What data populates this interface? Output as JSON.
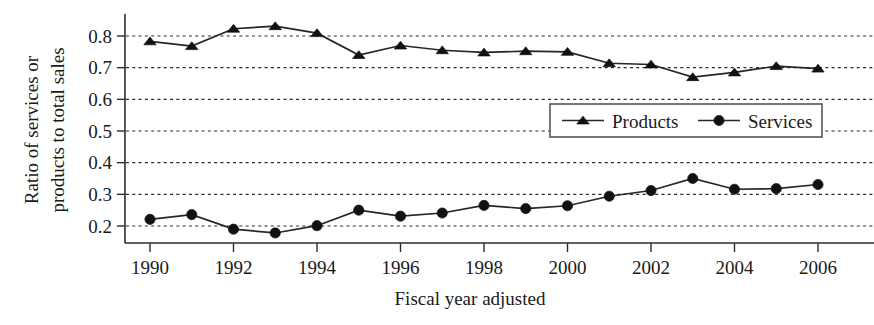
{
  "chart_data": {
    "type": "line",
    "title": "",
    "xlabel": "Fiscal year adjusted",
    "ylabel": "Ratio of services or products to total sales",
    "ylabel_line1": "Ratio of services or",
    "ylabel_line2": "products to total sales",
    "x": [
      1990,
      1991,
      1992,
      1993,
      1994,
      1995,
      1996,
      1997,
      1998,
      1999,
      2000,
      2001,
      2002,
      2003,
      2004,
      2005,
      2006
    ],
    "xtick_labels": [
      "1990",
      "1992",
      "1994",
      "1996",
      "1998",
      "2000",
      "2002",
      "2004",
      "2006"
    ],
    "xtick_values": [
      1990,
      1992,
      1994,
      1996,
      1998,
      2000,
      2002,
      2004,
      2006
    ],
    "ytick_labels": [
      "0.2",
      "0.3",
      "0.4",
      "0.5",
      "0.6",
      "0.7",
      "0.8"
    ],
    "ytick_values": [
      0.2,
      0.3,
      0.4,
      0.5,
      0.6,
      0.7,
      0.8
    ],
    "xlim": [
      1989.4,
      2006.6
    ],
    "ylim": [
      0.155,
      0.845
    ],
    "grid": true,
    "grid_axis": "y",
    "legend_position": "center-right",
    "series": [
      {
        "name": "Products",
        "marker": "triangle",
        "color": "#111111",
        "values": [
          0.783,
          0.768,
          0.823,
          0.831,
          0.809,
          0.74,
          0.77,
          0.755,
          0.748,
          0.752,
          0.75,
          0.714,
          0.71,
          0.67,
          0.685,
          0.705,
          0.697
        ]
      },
      {
        "name": "Services",
        "marker": "circle",
        "color": "#111111",
        "values": [
          0.221,
          0.236,
          0.19,
          0.178,
          0.201,
          0.25,
          0.231,
          0.241,
          0.265,
          0.255,
          0.264,
          0.294,
          0.312,
          0.35,
          0.316,
          0.318,
          0.331
        ]
      }
    ]
  },
  "legend": {
    "items": [
      {
        "label": "Products",
        "marker": "triangle"
      },
      {
        "label": "Services",
        "marker": "circle"
      }
    ]
  }
}
